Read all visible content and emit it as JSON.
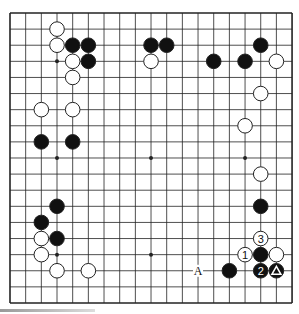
{
  "board": {
    "size": 19,
    "origin": {
      "x": 10,
      "y": 13
    },
    "spacing": {
      "x": 15.67,
      "y": 16.11
    },
    "line_color": "#222222",
    "background": "#ffffff",
    "star_points": [
      [
        3,
        3
      ],
      [
        9,
        3
      ],
      [
        15,
        3
      ],
      [
        3,
        9
      ],
      [
        9,
        9
      ],
      [
        15,
        9
      ],
      [
        3,
        15
      ],
      [
        9,
        15
      ],
      [
        15,
        15
      ]
    ]
  },
  "stones": [
    {
      "color": "white",
      "col": 3,
      "row": 1
    },
    {
      "color": "white",
      "col": 3,
      "row": 2
    },
    {
      "color": "black",
      "col": 4,
      "row": 2
    },
    {
      "color": "black",
      "col": 5,
      "row": 2
    },
    {
      "color": "white",
      "col": 4,
      "row": 3
    },
    {
      "color": "black",
      "col": 5,
      "row": 3
    },
    {
      "color": "white",
      "col": 4,
      "row": 4
    },
    {
      "color": "white",
      "col": 2,
      "row": 6
    },
    {
      "color": "white",
      "col": 4,
      "row": 6
    },
    {
      "color": "black",
      "col": 2,
      "row": 8
    },
    {
      "color": "black",
      "col": 4,
      "row": 8
    },
    {
      "color": "black",
      "col": 9,
      "row": 2
    },
    {
      "color": "black",
      "col": 10,
      "row": 2
    },
    {
      "color": "white",
      "col": 9,
      "row": 3
    },
    {
      "color": "black",
      "col": 13,
      "row": 3
    },
    {
      "color": "black",
      "col": 15,
      "row": 3
    },
    {
      "color": "black",
      "col": 16,
      "row": 2
    },
    {
      "color": "white",
      "col": 17,
      "row": 3
    },
    {
      "color": "white",
      "col": 16,
      "row": 5
    },
    {
      "color": "white",
      "col": 15,
      "row": 7
    },
    {
      "color": "white",
      "col": 16,
      "row": 10
    },
    {
      "color": "black",
      "col": 16,
      "row": 12
    },
    {
      "color": "white",
      "col": 16,
      "row": 14,
      "label": "3"
    },
    {
      "color": "white",
      "col": 15,
      "row": 15,
      "label": "1"
    },
    {
      "color": "black",
      "col": 16,
      "row": 15
    },
    {
      "color": "white",
      "col": 17,
      "row": 15
    },
    {
      "color": "black",
      "col": 16,
      "row": 16,
      "label": "2"
    },
    {
      "color": "black",
      "col": 17,
      "row": 16,
      "mark": "triangle"
    },
    {
      "color": "black",
      "col": 14,
      "row": 16
    },
    {
      "color": "black",
      "col": 3,
      "row": 12
    },
    {
      "color": "black",
      "col": 2,
      "row": 13
    },
    {
      "color": "white",
      "col": 2,
      "row": 14
    },
    {
      "color": "black",
      "col": 3,
      "row": 14
    },
    {
      "color": "white",
      "col": 2,
      "row": 15
    },
    {
      "color": "white",
      "col": 3,
      "row": 16
    },
    {
      "color": "white",
      "col": 5,
      "row": 16
    }
  ],
  "labels": [
    {
      "text": "A",
      "col": 12,
      "row": 16
    }
  ]
}
